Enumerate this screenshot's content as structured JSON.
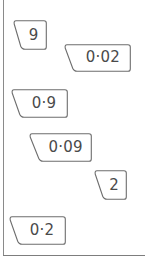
{
  "page": {
    "type": "worksheet-number-cards",
    "background_color": "#ffffff",
    "rule_color": "#8a8a8a",
    "card_outline_color": "#6e6e6e",
    "card_fill_color": "#ffffff",
    "text_color": "#4a4a4a"
  },
  "cards": [
    {
      "id": "card-9",
      "value": "9",
      "name": "number-card-9",
      "left": 13,
      "top": 20,
      "width": 34,
      "height": 30,
      "slant": 9,
      "narrow": true
    },
    {
      "id": "card-0-02",
      "value": "0·02",
      "name": "number-card-0-02",
      "left": 64,
      "top": 44,
      "width": 67,
      "height": 28,
      "slant": 10,
      "narrow": false
    },
    {
      "id": "card-0-9",
      "value": "0·9",
      "name": "number-card-0-9",
      "left": 11,
      "top": 89,
      "width": 57,
      "height": 29,
      "slant": 10,
      "narrow": false
    },
    {
      "id": "card-0-09",
      "value": "0·09",
      "name": "number-card-0-09",
      "left": 29,
      "top": 133,
      "width": 63,
      "height": 29,
      "slant": 11,
      "narrow": false
    },
    {
      "id": "card-2",
      "value": "2",
      "name": "number-card-2",
      "left": 94,
      "top": 170,
      "width": 33,
      "height": 30,
      "slant": 10,
      "narrow": true
    },
    {
      "id": "card-0-2",
      "value": "0·2",
      "name": "number-card-0-2",
      "left": 9,
      "top": 216,
      "width": 57,
      "height": 29,
      "slant": 10,
      "narrow": false
    }
  ]
}
